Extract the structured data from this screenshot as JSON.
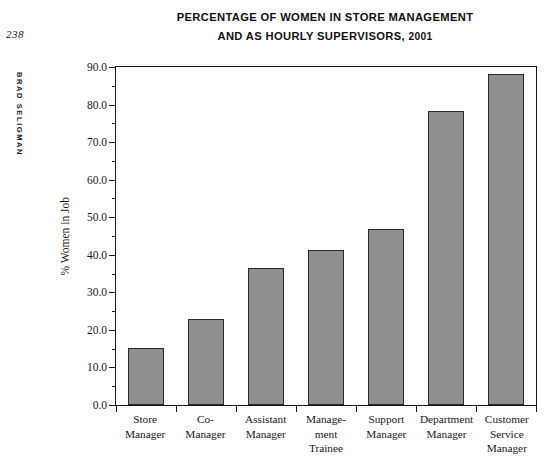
{
  "page": {
    "folio": "238",
    "running_head": "BRAD SELIGMAN"
  },
  "figure": {
    "title_line1": "PERCENTAGE OF WOMEN IN STORE MANAGEMENT",
    "title_line2": "AND AS HOURLY SUPERVISORS,",
    "title_year": "2001"
  },
  "chart_data": {
    "type": "bar",
    "title": "PERCENTAGE OF WOMEN IN STORE MANAGEMENT AND AS HOURLY SUPERVISORS, 2001",
    "xlabel": "",
    "ylabel": "% Women in Job",
    "ylim": [
      0.0,
      90.0
    ],
    "ytick_step": 10.0,
    "yminor_step": 5.0,
    "grid": false,
    "legend": false,
    "bar_color": "#8f8f8f",
    "bar_edge_color": "#2b2b2b",
    "categories": [
      "Store Manager",
      "Co-Manager",
      "Assistant Manager",
      "Management Trainee",
      "Support Manager",
      "Department Manager",
      "Customer Service Manager"
    ],
    "category_label_lines": [
      [
        "Store",
        "Manager"
      ],
      [
        "Co-",
        "Manager"
      ],
      [
        "Assistant",
        "Manager"
      ],
      [
        "Manage-",
        "ment",
        "Trainee"
      ],
      [
        "Support",
        "Manager"
      ],
      [
        "Department",
        "Manager"
      ],
      [
        "Customer",
        "Service",
        "Manager"
      ]
    ],
    "values": [
      15.3,
      22.8,
      36.6,
      41.4,
      46.9,
      78.2,
      88.2
    ],
    "ytick_labels": [
      "0.0",
      "10.0",
      "20.0",
      "30.0",
      "40.0",
      "50.0",
      "60.0",
      "70.0",
      "80.0",
      "90.0"
    ],
    "ytick_values": [
      0,
      10,
      20,
      30,
      40,
      50,
      60,
      70,
      80,
      90
    ]
  }
}
